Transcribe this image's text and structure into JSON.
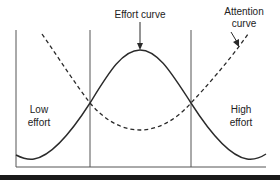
{
  "diagram": {
    "labels": {
      "effort_curve": "Effort curve",
      "attention_curve_line1": "Attention",
      "attention_curve_line2": "curve",
      "low_effort_line1": "Low",
      "low_effort_line2": "effort",
      "high_effort_line1": "High",
      "high_effort_line2": "effort"
    },
    "curves": [
      {
        "name": "Effort curve",
        "style": "solid",
        "shape": "bell, peaks in middle region"
      },
      {
        "name": "Attention curve",
        "style": "dashed",
        "shape": "inverted bell, minimum in middle region"
      }
    ],
    "regions": [
      "Low effort",
      "middle",
      "High effort"
    ],
    "colors": {
      "line": "#2a2a2a",
      "divider": "#555555",
      "bottom_bar": "#1a1a1a",
      "background": "#ffffff"
    }
  }
}
